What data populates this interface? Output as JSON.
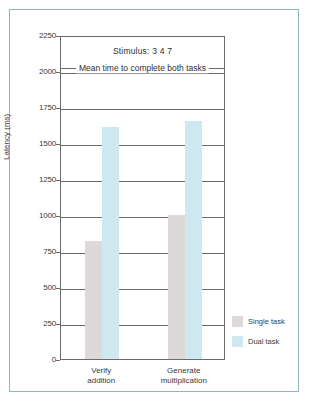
{
  "chart_data": {
    "type": "bar",
    "title": "Mean time to complete both tasks",
    "subtitle": "Stimulus:  3 4 7",
    "xlabel": "",
    "ylabel": "Latency (ms)",
    "ylim": [
      0,
      2250
    ],
    "grid": true,
    "legend_position": "right",
    "categories": [
      "Verify addition",
      "Generate multiplication"
    ],
    "category_lines": [
      [
        "Verify",
        "addition"
      ],
      [
        "Generate",
        "multiplication"
      ]
    ],
    "ytick_labels": [
      "2250",
      "2000",
      "1750",
      "1500",
      "1250",
      "1000",
      "750",
      "500",
      "250",
      "0"
    ],
    "ytick_values": [
      2250,
      2000,
      1750,
      1500,
      1250,
      1000,
      750,
      500,
      250,
      0
    ],
    "series": [
      {
        "name": "Single task",
        "color": "#ddd9d9",
        "values": [
          820,
          1000
        ]
      },
      {
        "name": "Dual task",
        "color": "#cfe7ef",
        "values": [
          1610,
          1650
        ]
      }
    ]
  },
  "legend": {
    "items": [
      {
        "label": "Single task"
      },
      {
        "label": "Dual task"
      }
    ]
  },
  "colors": {
    "frame_border": "#8fb5bd",
    "axis": "#6b6b6b",
    "single_task": "#ddd9d9",
    "dual_task": "#cfe7ef",
    "text": "#3a3a3a"
  }
}
